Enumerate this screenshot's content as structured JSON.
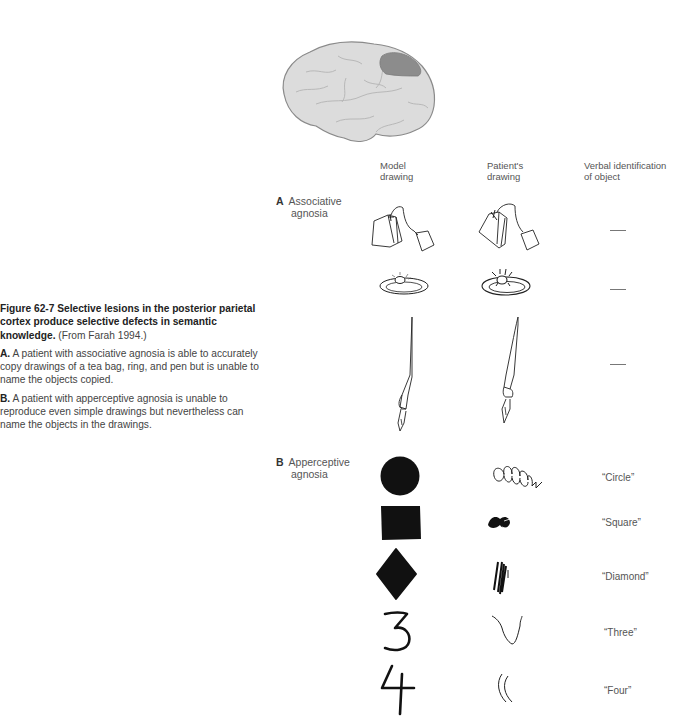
{
  "caption": {
    "figure_label": "Figure 62-7",
    "title": "Selective lesions in the posterior parietal cortex produce selective defects in semantic knowledge.",
    "source": "(From Farah 1994.)",
    "part_a_label": "A.",
    "part_a_text": "A patient with associative agnosia is able to accurately copy drawings of a tea bag, ring, and pen but is unable to name the objects copied.",
    "part_b_label": "B.",
    "part_b_text": "A patient with apperceptive agnosia is unable to reproduce even simple drawings but nevertheless can name the objects in the drawings."
  },
  "brain": {
    "icon": "brain-lateral-view-icon",
    "fill_color": "#d9d9d9",
    "lesion_color": "#8c8c8c",
    "lesion_region": "posterior parietal cortex"
  },
  "columns": {
    "model": [
      "Model",
      "drawing"
    ],
    "patient": [
      "Patient's",
      "drawing"
    ],
    "verbal": [
      "Verbal identification",
      "of object"
    ]
  },
  "sections": [
    {
      "letter": "A",
      "label_line1": "Associative",
      "label_line2": "agnosia",
      "rows": [
        {
          "object": "tea bag",
          "verbal": "—"
        },
        {
          "object": "ring",
          "verbal": "—"
        },
        {
          "object": "pen",
          "verbal": "—"
        }
      ]
    },
    {
      "letter": "B",
      "label_line1": "Apperceptive",
      "label_line2": "agnosia",
      "rows": [
        {
          "object": "circle",
          "verbal": "“Circle”"
        },
        {
          "object": "square",
          "verbal": "“Square”"
        },
        {
          "object": "diamond",
          "verbal": "“Diamond”"
        },
        {
          "object": "three",
          "verbal": "“Three”"
        },
        {
          "object": "four",
          "verbal": "“Four”"
        }
      ]
    }
  ]
}
